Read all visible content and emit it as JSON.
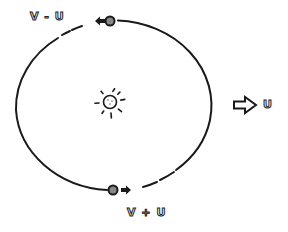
{
  "labels": {
    "top_velocity": "V - U",
    "bottom_velocity": "V + U",
    "frame_velocity": "U"
  },
  "colors": {
    "line": "#1a1a1a",
    "planet_fill": "#888888",
    "background": "#ffffff"
  },
  "elements": {
    "orbit": {
      "shape": "ellipse",
      "cx": 114,
      "cy": 105,
      "rx": 98,
      "ry": 85
    },
    "sun": {
      "cx": 110,
      "cy": 102,
      "r": 7,
      "rays": 8
    },
    "top_planet": {
      "cx": 110,
      "cy": 21,
      "arrow_direction": "left"
    },
    "bottom_planet": {
      "cx": 113,
      "cy": 190,
      "arrow_direction": "right"
    },
    "frame_arrow": {
      "direction": "right",
      "style": "hollow"
    }
  }
}
